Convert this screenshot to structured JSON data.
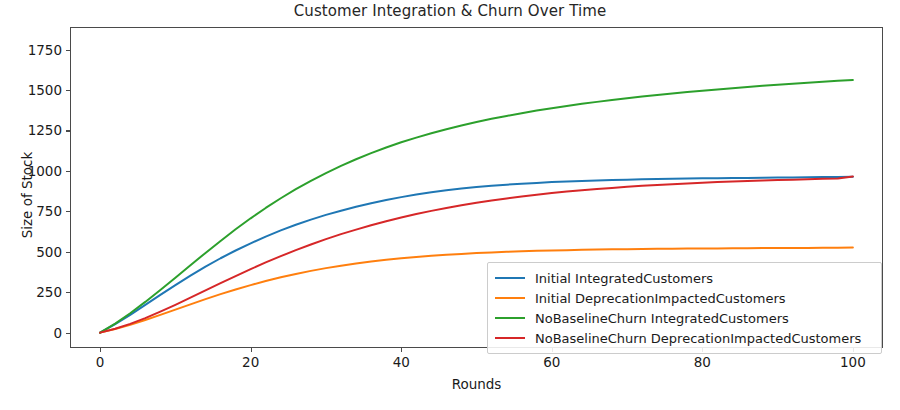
{
  "chart_data": {
    "type": "line",
    "title": "Customer Integration & Churn Over Time",
    "xlabel": "Rounds",
    "ylabel": "Size of Stock",
    "xlim": [
      -4,
      104
    ],
    "ylim": [
      -95,
      1890
    ],
    "grid": false,
    "legend_position": "lower right",
    "xticks": [
      0,
      20,
      40,
      60,
      80,
      100
    ],
    "yticks": [
      0,
      250,
      500,
      750,
      1000,
      1250,
      1500,
      1750
    ],
    "x": [
      0,
      2,
      4,
      6,
      8,
      10,
      12,
      14,
      16,
      18,
      20,
      22,
      24,
      26,
      28,
      30,
      32,
      34,
      36,
      38,
      40,
      42,
      44,
      46,
      48,
      50,
      52,
      54,
      56,
      58,
      60,
      62,
      64,
      66,
      68,
      70,
      72,
      74,
      76,
      78,
      80,
      82,
      84,
      86,
      88,
      90,
      92,
      94,
      96,
      98,
      100
    ],
    "series": [
      {
        "name": "Initial IntegratedCustomers",
        "color": "#1f77b4",
        "values": [
          0,
          52,
          110,
          172,
          234,
          294,
          352,
          408,
          460,
          508,
          552,
          594,
          632,
          667,
          699,
          728,
          754,
          778,
          800,
          820,
          838,
          854,
          868,
          880,
          891,
          900,
          908,
          915,
          921,
          926,
          931,
          935,
          938,
          941,
          944,
          946,
          948,
          950,
          952,
          953,
          954,
          955,
          956,
          957,
          958,
          959,
          960,
          961,
          962,
          963,
          964
        ]
      },
      {
        "name": "Initial DeprecationImpactedCustomers",
        "color": "#ff7f0e",
        "values": [
          0,
          22,
          48,
          78,
          110,
          142,
          175,
          207,
          238,
          267,
          294,
          319,
          342,
          363,
          382,
          399,
          414,
          428,
          440,
          451,
          460,
          468,
          475,
          481,
          487,
          492,
          496,
          500,
          503,
          506,
          508,
          510,
          512,
          514,
          515,
          516,
          517,
          518,
          519,
          520,
          521,
          521,
          522,
          522,
          523,
          523,
          524,
          524,
          525,
          525,
          526
        ]
      },
      {
        "name": "NoBaselineChurn IntegratedCustomers",
        "color": "#2ca02c",
        "values": [
          0,
          56,
          120,
          190,
          264,
          340,
          417,
          493,
          567,
          639,
          707,
          771,
          831,
          887,
          939,
          987,
          1031,
          1072,
          1110,
          1145,
          1177,
          1206,
          1233,
          1258,
          1281,
          1302,
          1322,
          1340,
          1357,
          1373,
          1388,
          1402,
          1415,
          1427,
          1439,
          1450,
          1460,
          1470,
          1479,
          1488,
          1496,
          1504,
          1512,
          1519,
          1526,
          1533,
          1539,
          1545,
          1551,
          1557,
          1562
        ]
      },
      {
        "name": "NoBaselineChurn DeprecationImpactedCustomers",
        "color": "#d62728",
        "values": [
          0,
          24,
          54,
          90,
          130,
          172,
          216,
          261,
          306,
          350,
          393,
          434,
          473,
          510,
          545,
          578,
          609,
          637,
          664,
          689,
          712,
          733,
          753,
          771,
          788,
          803,
          817,
          830,
          842,
          853,
          863,
          872,
          881,
          888,
          895,
          902,
          908,
          913,
          918,
          923,
          927,
          931,
          934,
          938,
          941,
          944,
          946,
          949,
          951,
          953,
          966
        ]
      }
    ]
  },
  "legend": {
    "items": [
      {
        "label": "Initial IntegratedCustomers",
        "color": "#1f77b4"
      },
      {
        "label": "Initial DeprecationImpactedCustomers",
        "color": "#ff7f0e"
      },
      {
        "label": "NoBaselineChurn IntegratedCustomers",
        "color": "#2ca02c"
      },
      {
        "label": "NoBaselineChurn DeprecationImpactedCustomers",
        "color": "#d62728"
      }
    ]
  }
}
